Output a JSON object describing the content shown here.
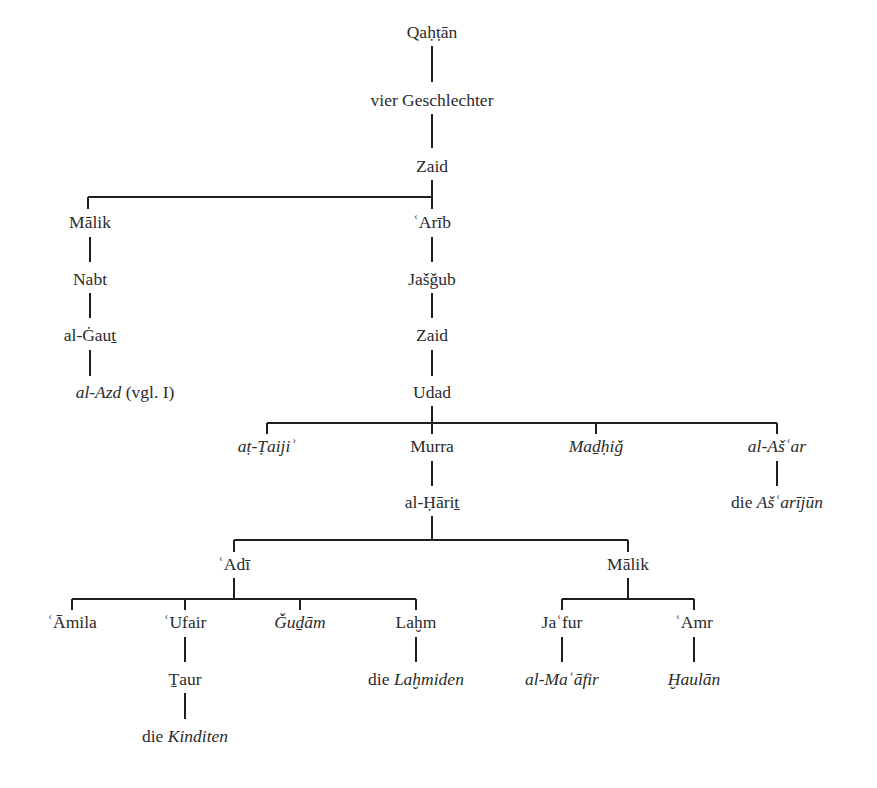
{
  "diagram": {
    "type": "genealogical-tree",
    "root": "Qaḥṭān",
    "nodes": [
      {
        "id": "qahtan",
        "parts": [
          {
            "text": "Qaḥṭān",
            "italic": false
          }
        ],
        "x": 432,
        "y": 22
      },
      {
        "id": "vier",
        "parts": [
          {
            "text": "vier Geschlechter",
            "italic": false
          }
        ],
        "x": 432,
        "y": 90
      },
      {
        "id": "zaid1",
        "parts": [
          {
            "text": "Zaid",
            "italic": false
          }
        ],
        "x": 432,
        "y": 156
      },
      {
        "id": "malik1",
        "parts": [
          {
            "text": "Mālik",
            "italic": false
          }
        ],
        "x": 90,
        "y": 212
      },
      {
        "id": "arib",
        "parts": [
          {
            "text": "ʿArīb",
            "italic": false
          }
        ],
        "x": 432,
        "y": 212
      },
      {
        "id": "nabt",
        "parts": [
          {
            "text": "Nabt",
            "italic": false
          }
        ],
        "x": 90,
        "y": 269
      },
      {
        "id": "jasgub",
        "parts": [
          {
            "text": "Jašǧub",
            "italic": false
          }
        ],
        "x": 432,
        "y": 269
      },
      {
        "id": "gaut",
        "parts": [
          {
            "text": "al-Ġauṯ",
            "italic": false
          }
        ],
        "x": 90,
        "y": 325
      },
      {
        "id": "zaid2",
        "parts": [
          {
            "text": "Zaid",
            "italic": false
          }
        ],
        "x": 432,
        "y": 325
      },
      {
        "id": "azd",
        "parts": [
          {
            "text": "al-Azd",
            "italic": true
          },
          {
            "text": " (vgl. I)",
            "italic": false
          }
        ],
        "x": 125,
        "y": 382
      },
      {
        "id": "udad",
        "parts": [
          {
            "text": "Udad",
            "italic": false
          }
        ],
        "x": 432,
        "y": 382
      },
      {
        "id": "taiji",
        "parts": [
          {
            "text": "aṭ-Ṭaijiʾ",
            "italic": true
          }
        ],
        "x": 267,
        "y": 436
      },
      {
        "id": "murra",
        "parts": [
          {
            "text": "Murra",
            "italic": false
          }
        ],
        "x": 432,
        "y": 436
      },
      {
        "id": "madhig",
        "parts": [
          {
            "text": "Maḏḥiǧ",
            "italic": true
          }
        ],
        "x": 596,
        "y": 436
      },
      {
        "id": "asar",
        "parts": [
          {
            "text": "al-Ašʿar",
            "italic": true
          }
        ],
        "x": 777,
        "y": 436
      },
      {
        "id": "harit",
        "parts": [
          {
            "text": "al-Ḥāriṯ",
            "italic": false
          }
        ],
        "x": 432,
        "y": 492
      },
      {
        "id": "asarijun",
        "parts": [
          {
            "text": "die ",
            "italic": false
          },
          {
            "text": "Ašʿarījūn",
            "italic": true
          }
        ],
        "x": 777,
        "y": 492
      },
      {
        "id": "adi",
        "parts": [
          {
            "text": "ʿAdī",
            "italic": false
          }
        ],
        "x": 234,
        "y": 554
      },
      {
        "id": "malik2",
        "parts": [
          {
            "text": "Mālik",
            "italic": false
          }
        ],
        "x": 628,
        "y": 554
      },
      {
        "id": "amila",
        "parts": [
          {
            "text": "ʿĀmila",
            "italic": false
          }
        ],
        "x": 72,
        "y": 612
      },
      {
        "id": "ufair",
        "parts": [
          {
            "text": "ʿUfair",
            "italic": false
          }
        ],
        "x": 185,
        "y": 612
      },
      {
        "id": "gudam",
        "parts": [
          {
            "text": "Ǧuḏām",
            "italic": true
          }
        ],
        "x": 300,
        "y": 612
      },
      {
        "id": "lahm",
        "parts": [
          {
            "text": "Laḫm",
            "italic": false
          }
        ],
        "x": 416,
        "y": 612
      },
      {
        "id": "jafur",
        "parts": [
          {
            "text": "Jaʿfur",
            "italic": false
          }
        ],
        "x": 562,
        "y": 612
      },
      {
        "id": "amr",
        "parts": [
          {
            "text": "ʿAmr",
            "italic": false
          }
        ],
        "x": 694,
        "y": 612
      },
      {
        "id": "taur",
        "parts": [
          {
            "text": "Ṯaur",
            "italic": false
          }
        ],
        "x": 185,
        "y": 669
      },
      {
        "id": "lahmiden",
        "parts": [
          {
            "text": "die ",
            "italic": false
          },
          {
            "text": "Laḫmiden",
            "italic": true
          }
        ],
        "x": 416,
        "y": 669
      },
      {
        "id": "maafir",
        "parts": [
          {
            "text": "al-Maʿāfir",
            "italic": true
          }
        ],
        "x": 562,
        "y": 669
      },
      {
        "id": "haulan",
        "parts": [
          {
            "text": "Ḫaulān",
            "italic": true
          }
        ],
        "x": 694,
        "y": 669
      },
      {
        "id": "kinditen",
        "parts": [
          {
            "text": "die ",
            "italic": false
          },
          {
            "text": "Kinditen",
            "italic": true
          }
        ],
        "x": 185,
        "y": 726
      }
    ],
    "edges": [
      {
        "from": "qahtan",
        "to": [
          "vier"
        ]
      },
      {
        "from": "vier",
        "to": [
          "zaid1"
        ]
      },
      {
        "from": "zaid1",
        "to": [
          "malik1",
          "arib"
        ]
      },
      {
        "from": "malik1",
        "to": [
          "nabt"
        ]
      },
      {
        "from": "nabt",
        "to": [
          "gaut"
        ]
      },
      {
        "from": "gaut",
        "to": [
          "azd"
        ]
      },
      {
        "from": "arib",
        "to": [
          "jasgub"
        ]
      },
      {
        "from": "jasgub",
        "to": [
          "zaid2"
        ]
      },
      {
        "from": "zaid2",
        "to": [
          "udad"
        ]
      },
      {
        "from": "udad",
        "to": [
          "taiji",
          "murra",
          "madhig",
          "asar"
        ]
      },
      {
        "from": "murra",
        "to": [
          "harit"
        ]
      },
      {
        "from": "asar",
        "to": [
          "asarijun"
        ]
      },
      {
        "from": "harit",
        "to": [
          "adi",
          "malik2"
        ]
      },
      {
        "from": "adi",
        "to": [
          "amila",
          "ufair",
          "gudam",
          "lahm"
        ]
      },
      {
        "from": "malik2",
        "to": [
          "jafur",
          "amr"
        ]
      },
      {
        "from": "ufair",
        "to": [
          "taur"
        ]
      },
      {
        "from": "taur",
        "to": [
          "kinditen"
        ]
      },
      {
        "from": "lahm",
        "to": [
          "lahmiden"
        ]
      },
      {
        "from": "jafur",
        "to": [
          "maafir"
        ]
      },
      {
        "from": "amr",
        "to": [
          "haulan"
        ]
      }
    ],
    "lines": [
      {
        "x1": 432,
        "y1": 46,
        "x2": 432,
        "y2": 82
      },
      {
        "x1": 432,
        "y1": 114,
        "x2": 432,
        "y2": 148
      },
      {
        "x1": 432,
        "y1": 180,
        "x2": 432,
        "y2": 209
      },
      {
        "x1": 88,
        "y1": 197,
        "x2": 432,
        "y2": 197
      },
      {
        "x1": 88,
        "y1": 197,
        "x2": 88,
        "y2": 209
      },
      {
        "x1": 90,
        "y1": 237,
        "x2": 90,
        "y2": 262
      },
      {
        "x1": 432,
        "y1": 237,
        "x2": 432,
        "y2": 262
      },
      {
        "x1": 90,
        "y1": 293,
        "x2": 90,
        "y2": 318
      },
      {
        "x1": 432,
        "y1": 293,
        "x2": 432,
        "y2": 318
      },
      {
        "x1": 90,
        "y1": 350,
        "x2": 90,
        "y2": 376
      },
      {
        "x1": 432,
        "y1": 350,
        "x2": 432,
        "y2": 376
      },
      {
        "x1": 432,
        "y1": 406,
        "x2": 432,
        "y2": 434
      },
      {
        "x1": 267,
        "y1": 423,
        "x2": 777,
        "y2": 423
      },
      {
        "x1": 267,
        "y1": 423,
        "x2": 267,
        "y2": 434
      },
      {
        "x1": 596,
        "y1": 423,
        "x2": 596,
        "y2": 434
      },
      {
        "x1": 777,
        "y1": 423,
        "x2": 777,
        "y2": 434
      },
      {
        "x1": 432,
        "y1": 461,
        "x2": 432,
        "y2": 486
      },
      {
        "x1": 777,
        "y1": 461,
        "x2": 777,
        "y2": 486
      },
      {
        "x1": 432,
        "y1": 516,
        "x2": 432,
        "y2": 540
      },
      {
        "x1": 234,
        "y1": 540,
        "x2": 628,
        "y2": 540
      },
      {
        "x1": 234,
        "y1": 540,
        "x2": 234,
        "y2": 552
      },
      {
        "x1": 628,
        "y1": 540,
        "x2": 628,
        "y2": 552
      },
      {
        "x1": 234,
        "y1": 578,
        "x2": 234,
        "y2": 599
      },
      {
        "x1": 72,
        "y1": 599,
        "x2": 416,
        "y2": 599
      },
      {
        "x1": 72,
        "y1": 599,
        "x2": 72,
        "y2": 610
      },
      {
        "x1": 185,
        "y1": 599,
        "x2": 185,
        "y2": 610
      },
      {
        "x1": 300,
        "y1": 599,
        "x2": 300,
        "y2": 610
      },
      {
        "x1": 416,
        "y1": 599,
        "x2": 416,
        "y2": 610
      },
      {
        "x1": 628,
        "y1": 578,
        "x2": 628,
        "y2": 599
      },
      {
        "x1": 562,
        "y1": 599,
        "x2": 694,
        "y2": 599
      },
      {
        "x1": 562,
        "y1": 599,
        "x2": 562,
        "y2": 610
      },
      {
        "x1": 694,
        "y1": 599,
        "x2": 694,
        "y2": 610
      },
      {
        "x1": 185,
        "y1": 637,
        "x2": 185,
        "y2": 662
      },
      {
        "x1": 416,
        "y1": 637,
        "x2": 416,
        "y2": 662
      },
      {
        "x1": 562,
        "y1": 637,
        "x2": 562,
        "y2": 662
      },
      {
        "x1": 694,
        "y1": 637,
        "x2": 694,
        "y2": 662
      },
      {
        "x1": 185,
        "y1": 693,
        "x2": 185,
        "y2": 719
      }
    ]
  }
}
